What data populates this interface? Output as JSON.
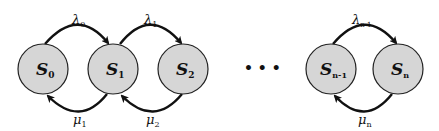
{
  "diagram": {
    "type": "birth-death state transition diagram",
    "states": [
      {
        "id": "s0",
        "symbol": "S",
        "sub": "0",
        "cx": 43
      },
      {
        "id": "s1",
        "symbol": "S",
        "sub": "1",
        "cx": 113
      },
      {
        "id": "s2",
        "symbol": "S",
        "sub": "2",
        "cx": 183
      },
      {
        "id": "sn-1",
        "symbol": "S",
        "sub": "n-1",
        "cx": 331
      },
      {
        "id": "sn",
        "symbol": "S",
        "sub": "n",
        "cx": 398
      }
    ],
    "ellipsis": "• • •",
    "forward_transitions": [
      {
        "from": "s0",
        "to": "s1",
        "symbol": "λ",
        "sub": "0"
      },
      {
        "from": "s1",
        "to": "s2",
        "symbol": "λ",
        "sub": "1"
      },
      {
        "from": "sn-1",
        "to": "sn",
        "symbol": "λ",
        "sub": "n-1"
      }
    ],
    "backward_transitions": [
      {
        "from": "s1",
        "to": "s0",
        "symbol": "μ",
        "sub": "1"
      },
      {
        "from": "s2",
        "to": "s1",
        "symbol": "μ",
        "sub": "2"
      },
      {
        "from": "sn",
        "to": "sn-1",
        "symbol": "μ",
        "sub": "n"
      }
    ],
    "colors": {
      "node_fill": "#d6d6d6",
      "stroke": "#111111"
    }
  }
}
